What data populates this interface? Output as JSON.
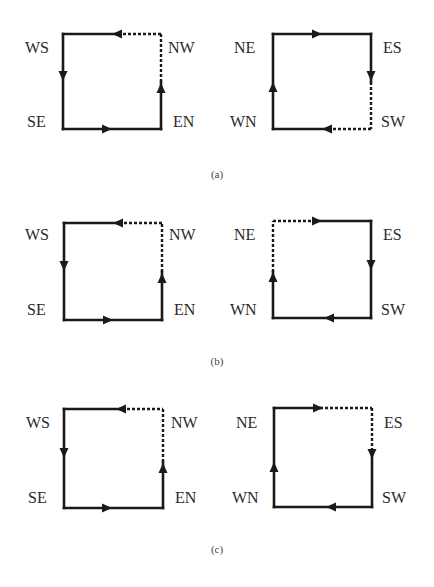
{
  "figure": {
    "colors": {
      "stroke": "#1a1a1a",
      "label": "#2a2a2a",
      "caption": "#444444",
      "background": "#ffffff"
    },
    "panels": [
      {
        "caption": "(a)",
        "loops": [
          {
            "name": "left",
            "corners": {
              "top_left": "WS",
              "top_right": "NW",
              "bottom_left": "SE",
              "bottom_right": "EN"
            },
            "direction": "counter-clockwise",
            "edges": {
              "top": {
                "style": "half-dashed-right",
                "arrow": "left"
              },
              "left": {
                "style": "solid",
                "arrow": "down"
              },
              "bottom": {
                "style": "solid",
                "arrow": "right"
              },
              "right": {
                "style": "half-dashed-top",
                "arrow": "up"
              }
            }
          },
          {
            "name": "right",
            "corners": {
              "top_left": "NE",
              "top_right": "ES",
              "bottom_left": "WN",
              "bottom_right": "SW"
            },
            "direction": "clockwise",
            "edges": {
              "top": {
                "style": "solid",
                "arrow": "right"
              },
              "right": {
                "style": "half-dashed-bottom",
                "arrow": "down"
              },
              "bottom": {
                "style": "half-dashed-right",
                "arrow": "left"
              },
              "left": {
                "style": "solid",
                "arrow": "up"
              }
            }
          }
        ]
      },
      {
        "caption": "(b)",
        "loops": [
          {
            "name": "left",
            "corners": {
              "top_left": "WS",
              "top_right": "NW",
              "bottom_left": "SE",
              "bottom_right": "EN"
            },
            "direction": "counter-clockwise",
            "edges": {
              "top": {
                "style": "half-dashed-right",
                "arrow": "left"
              },
              "left": {
                "style": "solid",
                "arrow": "down"
              },
              "bottom": {
                "style": "solid",
                "arrow": "right"
              },
              "right": {
                "style": "half-dashed-top",
                "arrow": "up"
              }
            }
          },
          {
            "name": "right",
            "corners": {
              "top_left": "NE",
              "top_right": "ES",
              "bottom_left": "WN",
              "bottom_right": "SW"
            },
            "direction": "clockwise",
            "edges": {
              "top": {
                "style": "half-dashed-left",
                "arrow": "right"
              },
              "right": {
                "style": "solid",
                "arrow": "down"
              },
              "bottom": {
                "style": "solid",
                "arrow": "left"
              },
              "left": {
                "style": "half-dashed-top",
                "arrow": "up"
              }
            }
          }
        ]
      },
      {
        "caption": "(c)",
        "loops": [
          {
            "name": "left",
            "corners": {
              "top_left": "WS",
              "top_right": "NW",
              "bottom_left": "SE",
              "bottom_right": "EN"
            },
            "direction": "counter-clockwise",
            "edges": {
              "top": {
                "style": "half-dashed-right",
                "arrow": "left"
              },
              "left": {
                "style": "solid",
                "arrow": "down"
              },
              "bottom": {
                "style": "solid",
                "arrow": "right"
              },
              "right": {
                "style": "half-dashed-top",
                "arrow": "up"
              }
            }
          },
          {
            "name": "right",
            "corners": {
              "top_left": "NE",
              "top_right": "ES",
              "bottom_left": "WN",
              "bottom_right": "SW"
            },
            "direction": "clockwise",
            "edges": {
              "top": {
                "style": "half-dashed-right",
                "arrow": "right"
              },
              "right": {
                "style": "half-dashed-top",
                "arrow": "down"
              },
              "bottom": {
                "style": "solid",
                "arrow": "left"
              },
              "left": {
                "style": "solid",
                "arrow": "up"
              }
            }
          }
        ]
      }
    ]
  }
}
